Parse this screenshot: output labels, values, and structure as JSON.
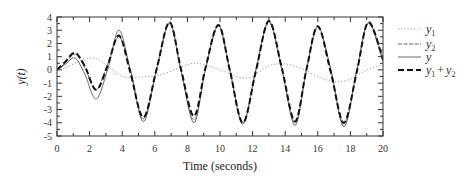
{
  "chart_data": {
    "type": "line",
    "title": "",
    "xlabel": "Time (seconds)",
    "ylabel": "y(t)",
    "xlim": [
      0,
      20
    ],
    "ylim": [
      -5,
      4
    ],
    "xticks": [
      0,
      2,
      4,
      6,
      8,
      10,
      12,
      14,
      16,
      18,
      20
    ],
    "yticks": [
      4,
      3,
      2,
      1,
      0,
      -1,
      -2,
      -3,
      -4,
      -5
    ],
    "grid": false,
    "legend_position": "right-outside",
    "legend": [
      {
        "key": "y1",
        "base": "y",
        "sub": "1",
        "plus_base": "",
        "plus_sub": ""
      },
      {
        "key": "y2",
        "base": "y",
        "sub": "2",
        "plus_base": "",
        "plus_sub": ""
      },
      {
        "key": "y",
        "base": "y",
        "sub": "",
        "plus_base": "",
        "plus_sub": ""
      },
      {
        "key": "y1+y2",
        "base": "y",
        "sub": "1",
        "plus_base": "y",
        "plus_sub": "2"
      }
    ],
    "series": [
      {
        "name": "y1",
        "style": "dotted",
        "color": "#9a9a9a",
        "width": 1,
        "x": [
          0,
          0.5,
          1,
          1.5,
          2,
          2.5,
          3,
          3.5,
          4,
          4.5,
          5,
          6,
          7,
          8,
          8.5,
          9,
          10,
          11,
          11.5,
          12,
          13,
          14,
          15,
          16,
          17,
          18,
          19,
          20
        ],
        "values": [
          0,
          0.15,
          0.45,
          0.75,
          0.9,
          0.8,
          0.4,
          -0.1,
          -0.5,
          -0.6,
          -0.55,
          -0.45,
          -0.1,
          0.4,
          0.5,
          0.4,
          0,
          -0.5,
          -0.6,
          -0.5,
          0.3,
          0.45,
          0.1,
          -0.5,
          -0.9,
          -0.7,
          0,
          0.4
        ]
      },
      {
        "name": "y2",
        "style": "dashdot",
        "color": "#666666",
        "width": 1,
        "x": [
          0,
          0.5,
          1.1,
          1.7,
          2.4,
          3.1,
          3.8,
          4.5,
          5.3,
          6.1,
          6.9,
          7.6,
          8.4,
          9.1,
          9.9,
          10.6,
          11.4,
          12.2,
          13.0,
          13.8,
          14.6,
          15.3,
          16.0,
          16.8,
          17.6,
          18.4,
          19.1,
          20
        ],
        "values": [
          0,
          0.5,
          1.2,
          0.2,
          -1.5,
          0.4,
          2.5,
          0.0,
          -3.7,
          0.0,
          3.5,
          0.0,
          -3.8,
          0.0,
          3.3,
          0.0,
          -4.0,
          0.0,
          3.6,
          0.0,
          -4.0,
          0.0,
          3.2,
          0.0,
          -4.1,
          0.0,
          3.5,
          0.6
        ]
      },
      {
        "name": "y",
        "style": "solid",
        "color": "#444444",
        "width": 0.8,
        "x": [
          0,
          0.5,
          1.1,
          1.7,
          2.4,
          3.1,
          3.8,
          4.5,
          5.3,
          6.1,
          6.9,
          7.6,
          8.4,
          9.1,
          9.9,
          10.6,
          11.4,
          12.2,
          13.0,
          13.8,
          14.6,
          15.3,
          16.0,
          16.8,
          17.6,
          18.4,
          19.1,
          20
        ],
        "values": [
          0,
          0.4,
          0.9,
          -0.3,
          -2.2,
          0.0,
          3.0,
          0.0,
          -3.9,
          0.0,
          3.6,
          0.0,
          -4.0,
          0.0,
          3.4,
          0.0,
          -4.1,
          0.0,
          3.7,
          0.0,
          -4.2,
          0.0,
          3.3,
          0.0,
          -4.3,
          0.0,
          3.6,
          0.8
        ]
      },
      {
        "name": "y1+y2",
        "style": "dashed",
        "color": "#111111",
        "width": 2,
        "x": [
          0,
          0.5,
          1.1,
          1.7,
          2.4,
          3.1,
          3.8,
          4.5,
          5.3,
          6.1,
          6.9,
          7.6,
          8.4,
          9.1,
          9.9,
          10.6,
          11.4,
          12.2,
          13.0,
          13.8,
          14.6,
          15.3,
          16.0,
          16.8,
          17.6,
          18.4,
          19.1,
          20
        ],
        "values": [
          0,
          0.6,
          1.3,
          0.3,
          -1.5,
          0.3,
          2.6,
          -0.2,
          -3.6,
          0.0,
          3.6,
          0.1,
          -3.5,
          0.1,
          3.4,
          0.0,
          -4.0,
          -0.1,
          3.7,
          0.1,
          -3.9,
          0.0,
          3.3,
          -0.2,
          -4.0,
          -0.1,
          3.6,
          0.8
        ]
      }
    ]
  },
  "layout": {
    "plot": {
      "left": 57,
      "right": 383,
      "top": 17,
      "bottom": 136
    },
    "legend": {
      "x_line_start": 398,
      "x_line_end": 421,
      "x_text": 426,
      "rows_y": [
        29,
        44,
        57,
        70
      ]
    }
  }
}
